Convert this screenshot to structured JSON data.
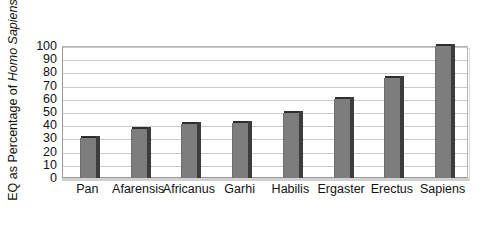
{
  "chart_data": {
    "type": "bar",
    "title": "",
    "subtitle": "",
    "xlabel": "",
    "ylabel": "EQ as Percentage of Homo Sapiens",
    "ylabel_plain_prefix": "EQ as Percentage of ",
    "ylabel_italic_part": "Homo Sapiens",
    "categories": [
      "Pan",
      "Afarensis",
      "Africanus",
      "Garhi",
      "Habilis",
      "Ergaster",
      "Erectus",
      "Sapiens"
    ],
    "values": [
      30,
      37,
      41,
      42,
      49,
      60,
      76,
      100
    ],
    "ylim": [
      0,
      100
    ],
    "ytick_step": 10,
    "ytick_labels": [
      "100",
      "90",
      "80",
      "70",
      "60",
      "50",
      "40",
      "30",
      "20",
      "10",
      "0"
    ],
    "ytick_values": [
      100,
      90,
      80,
      70,
      60,
      50,
      40,
      30,
      20,
      10,
      0
    ],
    "grid": true,
    "grid_axis": "y",
    "legend": false,
    "legend_position": "none",
    "series": [
      {
        "name": "EQ as Percentage of Homo Sapiens",
        "values": [
          30,
          37,
          41,
          42,
          49,
          60,
          76,
          100
        ]
      }
    ],
    "colors": {
      "bar_fill": "#7d7d7d",
      "bar_shadow": "#3c3c3c",
      "bar_top": "#2e2e2e",
      "gridline": "#c9c9c9",
      "axis": "#8a8a8a",
      "plot_background": "#ffffff",
      "figure_background": "#ffffff",
      "text": "#111111"
    }
  }
}
